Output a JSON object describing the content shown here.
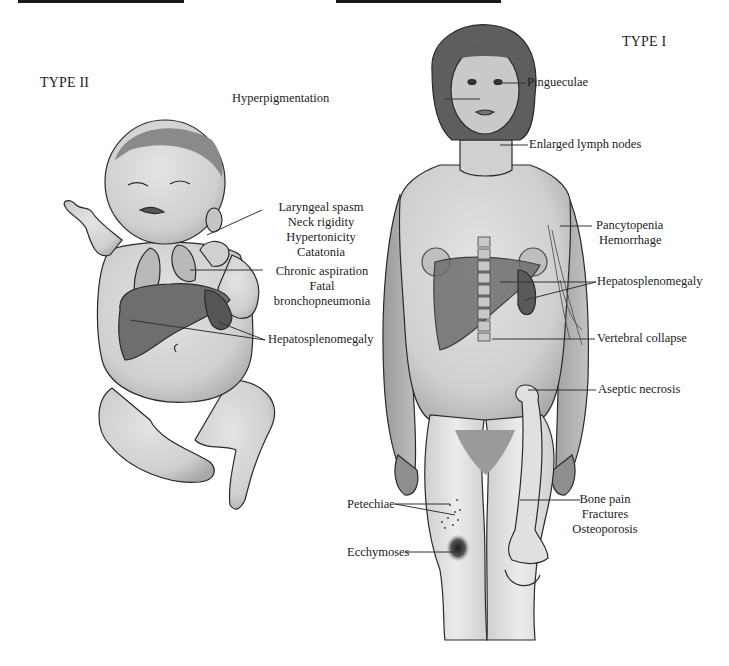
{
  "header_bars": [
    {
      "name": "left-rule"
    },
    {
      "name": "right-rule"
    }
  ],
  "type2": {
    "title": "TYPE II",
    "labels": {
      "neuro": [
        "Laryngeal spasm",
        "Neck rigidity",
        "Hypertonicity",
        "Catatonia"
      ],
      "lung": [
        "Chronic aspiration",
        "Fatal",
        "bronchopneumonia"
      ],
      "organ": "Hepatosplenomegaly"
    }
  },
  "type1": {
    "title": "TYPE I",
    "labels": {
      "eyes": "Pingueculae",
      "skin": "Hyperpigmentation",
      "neck": "Enlarged lymph nodes",
      "blood": [
        "Pancytopenia",
        "Hemorrhage"
      ],
      "organ": "Hepatosplenomegaly",
      "spine": "Vertebral collapse",
      "hip": "Aseptic necrosis",
      "bone": [
        "Bone pain",
        "Fractures",
        "Osteoporosis"
      ],
      "petechiae": "Petechiae",
      "ecchymoses": "Ecchymoses"
    }
  },
  "colors": {
    "skin": "#d4d4d4",
    "skin_shadow": "#a9a9a9",
    "organ": "#6e6e6e",
    "lung": "#b9b9b9",
    "hair": "#5a5a5a",
    "outline": "#2a2a2a",
    "leader_line": "#333333"
  }
}
